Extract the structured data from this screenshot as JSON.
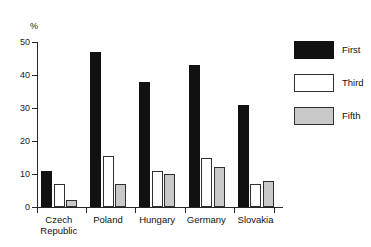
{
  "caption_fragment": "",
  "chart_data": {
    "type": "bar",
    "title": "",
    "xlabel": "",
    "ylabel": "%",
    "ylim": [
      0,
      50
    ],
    "yticks": [
      0,
      10,
      20,
      30,
      40,
      50
    ],
    "ytick_labels": [
      "0",
      "10",
      "20",
      "30",
      "40",
      "50"
    ],
    "grid": false,
    "legend_position": "top-right",
    "categories": [
      "Czech Republic",
      "Poland",
      "Hungary",
      "Germany",
      "Slovakia"
    ],
    "category_lines": [
      [
        "Czech",
        "Republic"
      ],
      [
        "Poland",
        ""
      ],
      [
        "Hungary",
        ""
      ],
      [
        "Germany",
        ""
      ],
      [
        "Slovakia",
        ""
      ]
    ],
    "series": [
      {
        "name": "First",
        "color": "#111111",
        "values": [
          11,
          47,
          38,
          43,
          31
        ]
      },
      {
        "name": "Third",
        "color": "#ffffff",
        "values": [
          7,
          15.5,
          11,
          15,
          7
        ]
      },
      {
        "name": "Fifth",
        "color": "#c9c9c9",
        "values": [
          2,
          7,
          10,
          12,
          8
        ]
      }
    ]
  },
  "legend": {
    "items": [
      {
        "label": "First",
        "style": "first"
      },
      {
        "label": "Third",
        "style": "third"
      },
      {
        "label": "Fifth",
        "style": "fifth"
      }
    ]
  },
  "colors": {
    "first": "#111111",
    "third": "#ffffff",
    "fifth": "#c9c9c9",
    "axis": "#262626",
    "text": "#111111",
    "background": "#ffffff"
  }
}
